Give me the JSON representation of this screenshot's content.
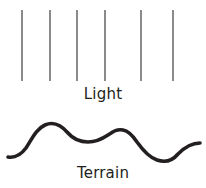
{
  "figure": {
    "background_color": "#ffffff",
    "title": "",
    "labels": {
      "light": "Light",
      "terrain": "Terrain"
    },
    "label_color": "#231f20",
    "light_rays": {
      "name": "light-rays",
      "count": 6,
      "color": "#58595b",
      "stroke_width": 1.4,
      "y_top": 10,
      "y_bottom": 81,
      "x_positions": [
        22,
        50,
        77,
        105,
        141,
        173
      ]
    },
    "terrain_curve": {
      "name": "terrain-profile",
      "color": "#231f20",
      "stroke_width": 3.6,
      "path": "M 8 157 C 14 158 20 156 26 148 C 32 139 36 129 45 125 C 54 121 62 126 68 133 C 74 140 80 142 88 142 C 96 142 102 139 108 135 C 114 131 117 129 123 130 C 129 131 133 136 137 142 C 142 149 148 157 157 160 C 166 163 173 160 178 154 C 184 148 192 143 200 143",
      "key_points": [
        {
          "label": "left-end",
          "x": 8,
          "y": 157
        },
        {
          "label": "peak-1",
          "x": 48,
          "y": 124
        },
        {
          "label": "trough-1",
          "x": 88,
          "y": 142
        },
        {
          "label": "peak-2",
          "x": 122,
          "y": 130
        },
        {
          "label": "trough-2",
          "x": 165,
          "y": 161
        },
        {
          "label": "right-end",
          "x": 200,
          "y": 143
        }
      ]
    }
  }
}
